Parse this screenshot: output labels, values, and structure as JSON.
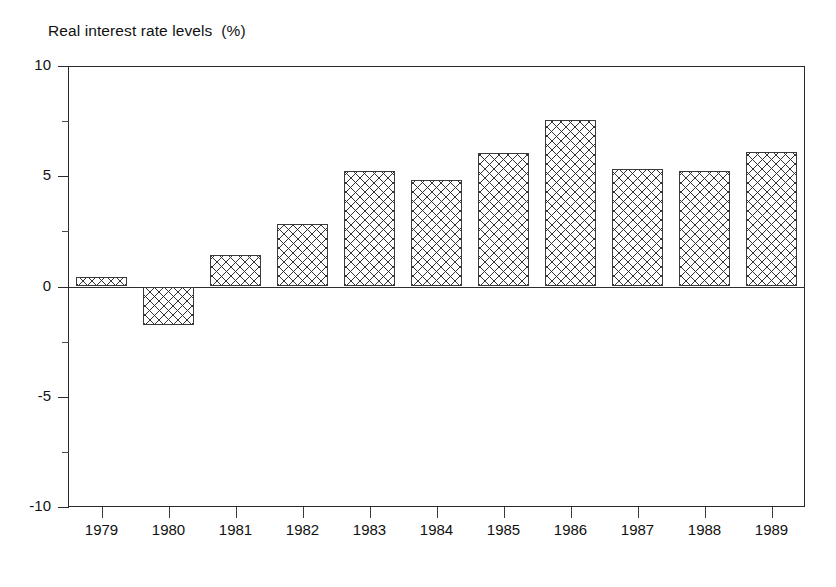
{
  "chart_data": {
    "type": "bar",
    "title": "Real interest rate levels  (%)",
    "xlabel": "",
    "ylabel": "",
    "ylim": [
      -10,
      10
    ],
    "yticks": [
      10,
      5,
      0,
      -5,
      -10
    ],
    "ytick_labels": [
      "10",
      "5",
      "0",
      "-5",
      "-10"
    ],
    "minor_yticks": [
      7.5,
      2.5,
      -2.5,
      -7.5
    ],
    "grid": false,
    "legend": null,
    "zero_line": 0,
    "categories": [
      "1979",
      "1980",
      "1981",
      "1982",
      "1983",
      "1984",
      "1985",
      "1986",
      "1987",
      "1988",
      "1989"
    ],
    "values": [
      0.45,
      -1.75,
      1.45,
      2.85,
      5.25,
      4.85,
      6.05,
      7.55,
      5.35,
      5.25,
      6.1
    ],
    "series": [
      {
        "name": "Real interest rate levels (%)",
        "values": [
          0.45,
          -1.75,
          1.45,
          2.85,
          5.25,
          4.85,
          6.05,
          7.55,
          5.35,
          5.25,
          6.1
        ]
      }
    ],
    "bar_style": "crosshatch-pattern",
    "bar_fill": "#ffffff",
    "bar_edge": "#3a3a3a"
  },
  "figure": {
    "background": "#ffffff",
    "frame_color": "#2a2a2a"
  }
}
